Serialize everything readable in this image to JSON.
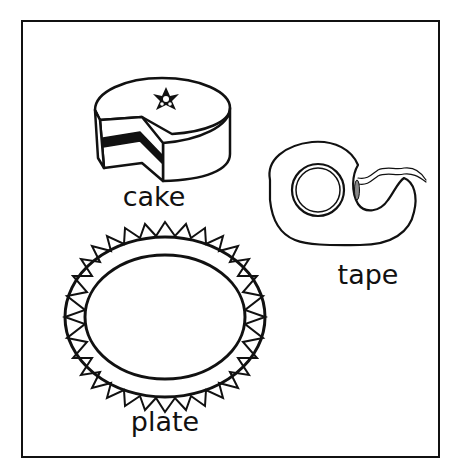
{
  "worksheet": {
    "items": [
      {
        "name": "cake",
        "label": "cake",
        "icon": "cake-icon",
        "label_x": 154,
        "label_y": 183
      },
      {
        "name": "tape",
        "label": "tape",
        "icon": "tape-dispenser-icon",
        "label_x": 368,
        "label_y": 261
      },
      {
        "name": "plate",
        "label": "plate",
        "icon": "plate-icon",
        "label_x": 165,
        "label_y": 408
      }
    ],
    "colors": {
      "ink": "#111111",
      "background": "#ffffff"
    }
  }
}
